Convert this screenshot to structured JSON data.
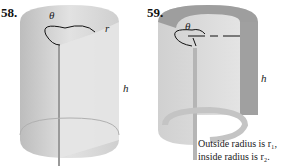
{
  "figures": [
    {
      "number": "58.",
      "labels": {
        "theta": "θ",
        "r": "r",
        "h": "h"
      }
    },
    {
      "number": "59.",
      "labels": {
        "theta": "θ",
        "h": "h"
      },
      "caption": {
        "line1": "Outside radius is r₁,",
        "line2": "inside radius is r₂."
      }
    }
  ]
}
